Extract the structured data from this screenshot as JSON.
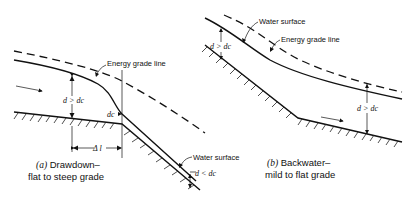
{
  "figure": {
    "panel_a": {
      "caption_line1": "(a) Drawdown–",
      "caption_line2": "flat to steep grade",
      "caption_prefix": "(a)",
      "caption_title": " Drawdown–",
      "labels": {
        "energy_grade_line": "Energy grade line",
        "water_surface": "Water surface",
        "depth_upstream": "d > dc",
        "critical_depth": "dc",
        "depth_downstream": "d < dc",
        "distance": "Δ l"
      }
    },
    "panel_b": {
      "caption_prefix": "(b)",
      "caption_title": " Backwater–",
      "caption_line2": "mild to flat grade",
      "labels": {
        "water_surface": "Water surface",
        "energy_grade_line": "Energy grade line",
        "depth_upstream": "d > dc",
        "depth_downstream": "d > dc"
      }
    }
  }
}
